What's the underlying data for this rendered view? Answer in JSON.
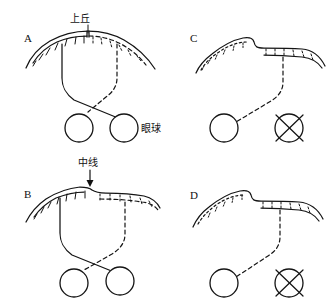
{
  "figure": {
    "background_color": "#ffffff",
    "ink_color": "#141414",
    "width": 335,
    "height": 308
  },
  "labels": {
    "superior_colliculus": "上丘",
    "eyeball": "眼球",
    "midline": "中线"
  },
  "panels": [
    {
      "id": "A",
      "letter": "A",
      "letter_x": 24,
      "letter_y": 42,
      "annotation": "上丘",
      "annotation_x": 74,
      "annotation_y": 22,
      "tectum_shape": "dome",
      "left_half_marking": "solid-hatch",
      "right_half_marking": "dashed-hatch",
      "left_eye_state": "normal",
      "right_eye_state": "normal",
      "left_eye_cx": 79,
      "left_eye_cy": 128,
      "right_eye_cx": 124,
      "right_eye_cy": 128,
      "eye_radius": 14,
      "projection_left": "solid",
      "projection_right": "dashed",
      "crossing": "crossed",
      "eyeball_label": "眼球",
      "eyeball_label_x": 141,
      "eyeball_label_y": 132
    },
    {
      "id": "B",
      "letter": "B",
      "letter_x": 24,
      "letter_y": 195,
      "annotation": "中线",
      "annotation_x": 80,
      "annotation_y": 166,
      "tectum_shape": "shifted-dome",
      "left_half_marking": "solid-hatch",
      "right_half_marking": "dashed-hatch",
      "left_eye_state": "normal",
      "right_eye_state": "normal",
      "left_eye_cx": 74,
      "left_eye_cy": 283,
      "right_eye_cx": 120,
      "right_eye_cy": 281,
      "eye_radius": 14,
      "projection_left": "solid",
      "projection_right": "dashed",
      "crossing": "crossed",
      "has_arrow": true
    },
    {
      "id": "C",
      "letter": "C",
      "letter_x": 190,
      "letter_y": 42,
      "annotation": "",
      "tectum_shape": "flat-ridge",
      "left_half_marking": "dotted",
      "right_half_marking": "dashed-hatch",
      "left_eye_state": "normal",
      "right_eye_state": "removed",
      "left_eye_cx": 224,
      "left_eye_cy": 128,
      "right_eye_cx": 289,
      "right_eye_cy": 128,
      "eye_radius": 14,
      "projection_left": "dashed",
      "projection_right": "none",
      "crossing": "single"
    },
    {
      "id": "D",
      "letter": "D",
      "letter_x": 190,
      "letter_y": 199,
      "annotation": "",
      "tectum_shape": "flat-ridge",
      "left_half_marking": "dotted",
      "right_half_marking": "dashed-hatch",
      "left_eye_state": "normal",
      "right_eye_state": "removed",
      "left_eye_cx": 224,
      "left_eye_cy": 283,
      "right_eye_cx": 289,
      "right_eye_cy": 283,
      "eye_radius": 14,
      "projection_left": "dashed",
      "projection_right": "none",
      "crossing": "single"
    }
  ],
  "legend_semantics": {
    "solid_line_meaning": "intact projection",
    "dashed_line_meaning": "contralateral / degenerate projection",
    "crossed_circle_meaning": "enucleated eye"
  }
}
